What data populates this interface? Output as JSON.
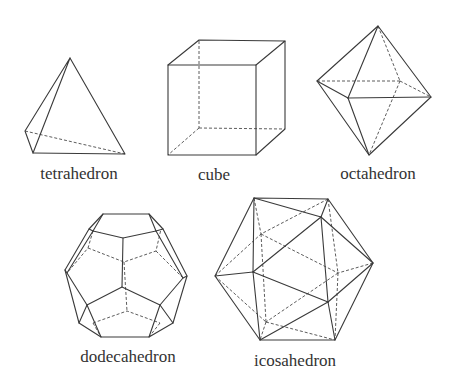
{
  "figure": {
    "solids": [
      {
        "name": "tetrahedron",
        "label": "tetrahedron",
        "faces": 4
      },
      {
        "name": "cube",
        "label": "cube",
        "faces": 6
      },
      {
        "name": "octahedron",
        "label": "octahedron",
        "faces": 8
      },
      {
        "name": "dodecahedron",
        "label": "dodecahedron",
        "faces": 12
      },
      {
        "name": "icosahedron",
        "label": "icosahedron",
        "faces": 20
      }
    ]
  },
  "colors": {
    "background": "#ffffff",
    "line": "#3a3a3a",
    "text": "#333333"
  }
}
